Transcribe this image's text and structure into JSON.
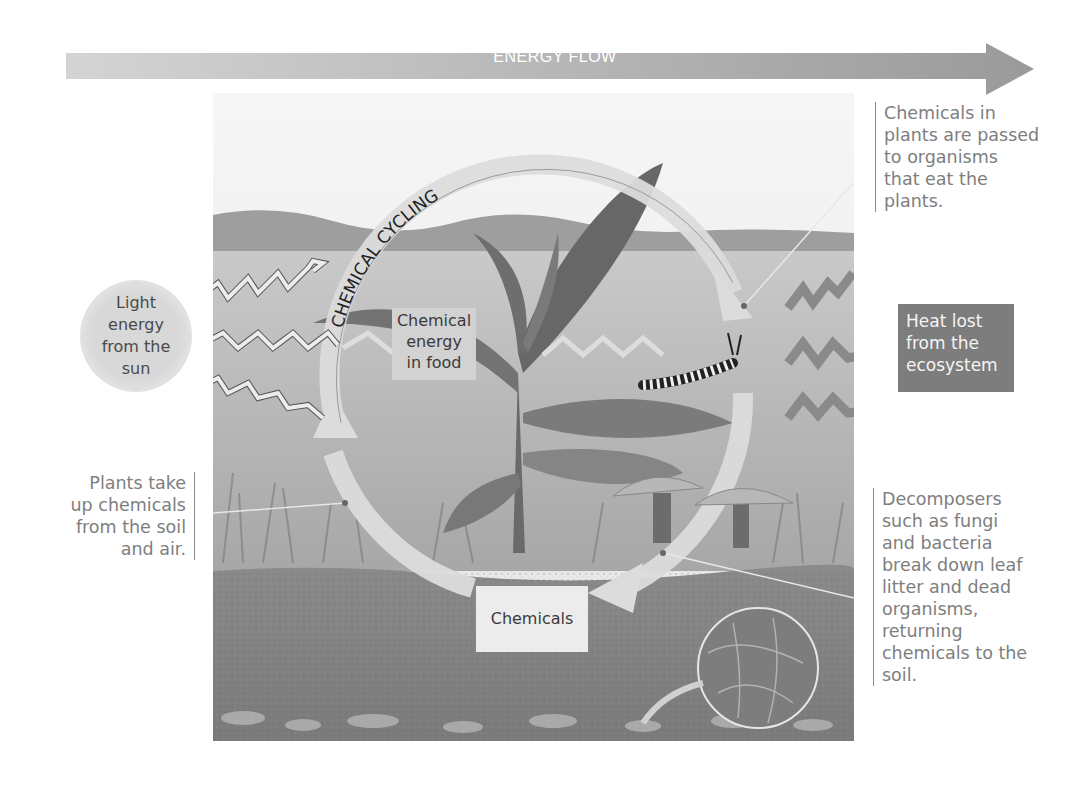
{
  "energy_flow": {
    "label": "ENERGY FLOW",
    "color": "#a9a9a9"
  },
  "cycle": {
    "label": "CHEMICAL CYCLING",
    "arrow_color": "#dcdcdc"
  },
  "boxes": {
    "chemical_energy": [
      "Chemical",
      "energy",
      "in food"
    ],
    "chemicals": "Chemicals",
    "sun": [
      "Light",
      "energy",
      "from the",
      "sun"
    ],
    "heat": [
      "Heat lost",
      "from the",
      "ecosystem"
    ],
    "heat_color": "#7d7d7d"
  },
  "callouts": {
    "consumers": [
      "Chemicals in",
      "plants are passed",
      "to organisms",
      "that eat the",
      "plants."
    ],
    "plants_uptake": [
      "Plants take",
      "up chemicals",
      "from the soil",
      "and air."
    ],
    "decomposers": [
      "Decomposers",
      "such as fungi",
      "and bacteria",
      "break down leaf",
      "litter and dead",
      "organisms,",
      "returning",
      "chemicals to the",
      "soil."
    ]
  },
  "icons": {
    "light_arrows": "zigzag-light-arrow",
    "heat_arrows": "zigzag-heat-arrow",
    "caterpillar": "caterpillar",
    "mushrooms": "mushroom",
    "magnifier": "magnified-hyphae-circle",
    "plant": "milkweed-plant"
  }
}
